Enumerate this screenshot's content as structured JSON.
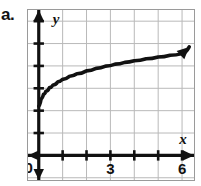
{
  "problem": {
    "label": "a."
  },
  "chart_data": {
    "type": "line",
    "title": "",
    "subtitle": "",
    "xlabel": "x",
    "ylabel": "y",
    "origin_label": "0",
    "xlim": [
      -0.45,
      6.5
    ],
    "ylim": [
      -1.1,
      6.5
    ],
    "xticks": [
      0,
      1,
      2,
      3,
      4,
      5,
      6
    ],
    "yticks": [
      0,
      1,
      2,
      3,
      4,
      5,
      6
    ],
    "xtick_labels": [
      "0",
      "",
      "",
      "3",
      "",
      "",
      "6"
    ],
    "ytick_labels": [
      "",
      "",
      "",
      "3",
      "",
      "",
      "6"
    ],
    "grid": true,
    "grid_color": "#b9b9b9",
    "axis_color": "#111111",
    "curve_color": "#111111",
    "legend": "none",
    "annotations": [],
    "axis_arrows": {
      "x_positive": true,
      "x_negative": true,
      "y_positive": true,
      "y_negative": true
    },
    "series": [
      {
        "name": "square-root curve",
        "arrow_end": true,
        "x": [
          0.0,
          0.1,
          0.2,
          0.3,
          0.45,
          0.6,
          0.8,
          1.0,
          1.3,
          1.6,
          2.0,
          2.4,
          2.8,
          3.2,
          3.6,
          4.0,
          4.5,
          5.0,
          5.5,
          6.0,
          6.3
        ],
        "y": [
          2.2,
          2.53,
          2.73,
          2.87,
          3.03,
          3.15,
          3.29,
          3.4,
          3.54,
          3.65,
          3.78,
          3.89,
          3.99,
          4.08,
          4.16,
          4.23,
          4.32,
          4.4,
          4.48,
          4.55,
          4.85
        ]
      }
    ]
  }
}
